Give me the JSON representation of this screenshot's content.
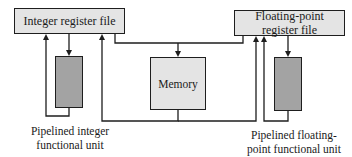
{
  "diagram": {
    "type": "block-diagram",
    "nodes": {
      "int_regfile": {
        "label": "Integer register file"
      },
      "fp_regfile": {
        "label_line1": "Floating-point",
        "label_line2": "register file"
      },
      "memory": {
        "label": "Memory"
      },
      "int_unit": {
        "label": ""
      },
      "fp_unit": {
        "label": ""
      }
    },
    "captions": {
      "int_unit_line1": "Pipelined integer",
      "int_unit_line2": "functional unit",
      "fp_unit_line1": "Pipelined floating-",
      "fp_unit_line2": "point functional unit"
    },
    "edges": [
      {
        "from": "int_regfile",
        "to": "int_unit"
      },
      {
        "from": "int_unit",
        "to": "int_regfile"
      },
      {
        "from": "int_regfile",
        "to": "memory"
      },
      {
        "from": "fp_regfile",
        "to": "memory"
      },
      {
        "from": "memory",
        "to": "int_regfile"
      },
      {
        "from": "memory",
        "to": "fp_regfile"
      },
      {
        "from": "fp_regfile",
        "to": "fp_unit"
      },
      {
        "from": "fp_unit",
        "to": "fp_regfile"
      }
    ],
    "colors": {
      "regfile_fill": "#e4e4e4",
      "memory_fill": "#e4e4e4",
      "unit_fill": "#a3a3a3",
      "line": "#1e1e1e"
    }
  }
}
